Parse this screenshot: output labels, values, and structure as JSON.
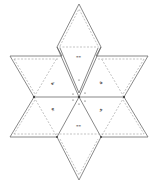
{
  "diagram": {
    "type": "papercraft-net",
    "shape": "hexagram",
    "colors": {
      "background": "#ffffff",
      "cut_line": "#6b6b6b",
      "fold_line": "#9a9a9a",
      "label": "#2b2b2b"
    },
    "panels": [
      {
        "id": "top",
        "label": "=="
      },
      {
        "id": "upper-left",
        "label": "8:"
      },
      {
        "id": "upper-right",
        "label": ":8"
      },
      {
        "id": "lower-left",
        "label": "8:"
      },
      {
        "id": "lower-right",
        "label": ":8"
      },
      {
        "id": "bottom",
        "label": "=="
      }
    ]
  }
}
